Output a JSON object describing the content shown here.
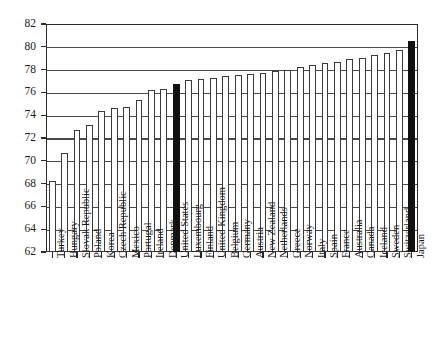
{
  "chart_data": {
    "type": "bar",
    "title": "",
    "xlabel": "",
    "ylabel": "",
    "ylim": [
      62,
      82
    ],
    "ytick_step": 2,
    "yticks": [
      62,
      64,
      66,
      68,
      70,
      72,
      74,
      76,
      78,
      80,
      82
    ],
    "grid": true,
    "legend": null,
    "categories": [
      "Turkey",
      "Hungary",
      "Slovak Republic",
      "Poland",
      "Korea",
      "Czech Republic",
      "Mexico",
      "Portugal",
      "Ireland",
      "Denmark",
      "United States",
      "Luxembourg",
      "Finland",
      "United Kingdom",
      "Belgium",
      "Germany",
      "Austria",
      "New Zealand",
      "Netherlands",
      "Greece",
      "Norway",
      "Italy",
      "Spain",
      "France",
      "Australia",
      "Canada",
      "Iceland",
      "Sweden",
      "Switzerland",
      "Japan"
    ],
    "values": [
      68.2,
      70.7,
      72.7,
      73.1,
      74.4,
      74.6,
      74.7,
      75.3,
      76.2,
      76.3,
      76.7,
      77.1,
      77.2,
      77.3,
      77.4,
      77.5,
      77.6,
      77.7,
      77.9,
      78.0,
      78.2,
      78.4,
      78.6,
      78.7,
      78.9,
      79.0,
      79.3,
      79.5,
      79.7,
      80.5
    ],
    "highlight_categories": [
      "United States",
      "Japan"
    ],
    "highlight_color": "#111111",
    "bar_color": "#ffffff",
    "bar_edge_color": "#3a3a3a"
  }
}
